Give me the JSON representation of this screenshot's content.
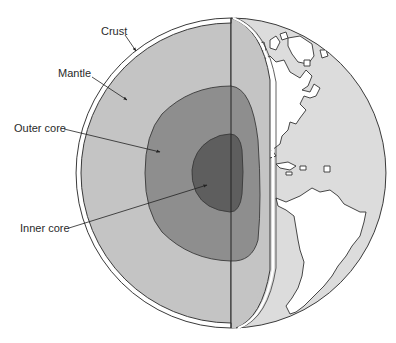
{
  "labels": {
    "crust": "Crust",
    "mantle": "Mantle",
    "outer_core": "Outer core",
    "inner_core": "Inner core"
  },
  "colors": {
    "background": "#ffffff",
    "outline": "#3a3a3a",
    "surface": "#dcdcdc",
    "mantle": "#c4c4c4",
    "outer_core": "#8e8e8e",
    "inner_core": "#5e5e5e",
    "continents": "#ffffff"
  },
  "layers": [
    {
      "name": "Crust",
      "order": 1
    },
    {
      "name": "Mantle",
      "order": 2
    },
    {
      "name": "Outer core",
      "order": 3
    },
    {
      "name": "Inner core",
      "order": 4
    }
  ]
}
